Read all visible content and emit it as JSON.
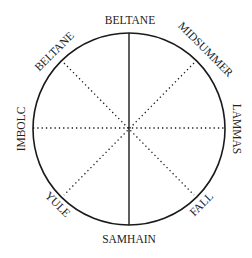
{
  "diagram": {
    "type": "wheel-of-the-year",
    "labels": {
      "top": "BELTANE",
      "top_left": "BELTANE",
      "top_right": "MIDSUMMER",
      "right": "LAMMAS",
      "bottom_right": "FALL",
      "bottom": "SAMHAIN",
      "bottom_left": "YULE",
      "left": "IMBOLC"
    },
    "lines": {
      "vertical": "solid",
      "horizontal": "dotted",
      "diagonals": "dotted"
    },
    "colors": {
      "stroke": "#1a1a1a",
      "text": "#222222",
      "background": "#ffffff"
    }
  }
}
